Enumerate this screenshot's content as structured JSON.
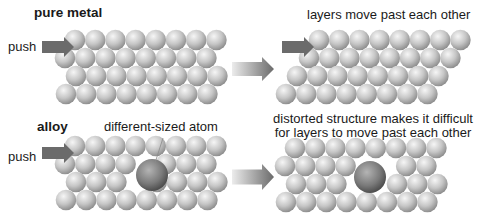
{
  "colors": {
    "background": "#ffffff",
    "atom_light": "#f4f4f4",
    "atom_mid": "#c4c4c4",
    "atom_dark": "#8e8e8e",
    "big_atom_light": "#b0b0b0",
    "big_atom_dark": "#4a4a4a",
    "push_arrow": "#6b6b6b",
    "transition_arrow_light": "#e8e8e8",
    "transition_arrow_dark": "#6a6a6a",
    "text": "#1a1a1a"
  },
  "panels": {
    "pure_before": {
      "title": "pure metal",
      "push_label": "push",
      "atom_radius": 10.3,
      "rows": [
        {
          "y": 40,
          "x_start": 75,
          "count": 8
        },
        {
          "y": 58,
          "x_start": 65,
          "count": 8
        },
        {
          "y": 76,
          "x_start": 76,
          "count": 8
        },
        {
          "y": 94,
          "x_start": 66,
          "count": 8
        }
      ],
      "push_arrow": {
        "x": 42,
        "y": 37,
        "w": 32,
        "h": 20
      }
    },
    "pure_after": {
      "caption": "layers move past each other",
      "atom_radius": 10.3,
      "rows": [
        {
          "y": 40,
          "x_start": 319,
          "count": 8
        },
        {
          "y": 58,
          "x_start": 309,
          "count": 8
        },
        {
          "y": 76,
          "x_start": 297,
          "count": 8
        },
        {
          "y": 94,
          "x_start": 286,
          "count": 8
        }
      ],
      "push_arrow": {
        "x": 282,
        "y": 37,
        "w": 32,
        "h": 20
      }
    },
    "alloy_before": {
      "title": "alloy",
      "push_label": "push",
      "annotation": "different-sized atom",
      "atom_radius": 10.3,
      "rows": [
        {
          "y": 146,
          "x_start": 75,
          "count": 8,
          "skip": []
        },
        {
          "y": 164,
          "x_start": 65,
          "count": 8,
          "skip": [
            4
          ]
        },
        {
          "y": 182,
          "x_start": 76,
          "count": 8,
          "skip": [
            3
          ]
        },
        {
          "y": 200,
          "x_start": 66,
          "count": 8,
          "skip": []
        }
      ],
      "big_atom": {
        "cx": 152,
        "cy": 175,
        "r": 16
      },
      "push_arrow": {
        "x": 42,
        "y": 143,
        "w": 32,
        "h": 20
      }
    },
    "alloy_after": {
      "caption_line1": "distorted structure makes it difficult",
      "caption_line2": "for layers to move past each other",
      "atom_radius": 10.3,
      "rows": [
        {
          "y": 148,
          "x_start": 295,
          "count": 8,
          "skip": []
        },
        {
          "y": 166,
          "x_start": 285,
          "count": 8,
          "skip": [
            4,
            5
          ]
        },
        {
          "y": 184,
          "x_start": 296,
          "count": 8,
          "skip": [
            3,
            4
          ]
        },
        {
          "y": 202,
          "x_start": 286,
          "count": 8,
          "skip": []
        }
      ],
      "big_atom": {
        "cx": 370,
        "cy": 177,
        "r": 16
      }
    }
  },
  "transition_arrows": [
    {
      "x": 232,
      "y": 57,
      "w": 42,
      "h": 24
    },
    {
      "x": 232,
      "y": 164,
      "w": 42,
      "h": 26
    }
  ],
  "atom_spacing": 20.2
}
